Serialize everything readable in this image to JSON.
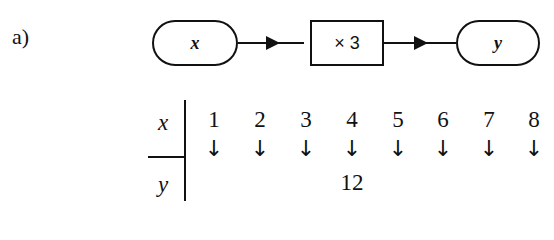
{
  "label": "a)",
  "machine": {
    "input": "x",
    "operation": "× 3",
    "output": "y"
  },
  "table": {
    "row_headers": [
      "x",
      "y"
    ],
    "x_values": [
      "1",
      "2",
      "3",
      "4",
      "5",
      "6",
      "7",
      "8"
    ],
    "y_values": [
      "",
      "",
      "",
      "12",
      "",
      "",
      "",
      ""
    ],
    "arrow": "↓"
  }
}
